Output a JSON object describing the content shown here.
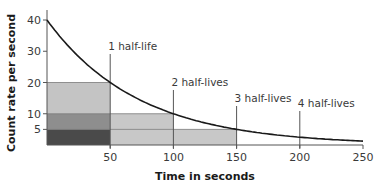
{
  "chart_data": {
    "type": "line",
    "title": "",
    "xlabel": "Time in seconds",
    "ylabel": "Count rate per second",
    "xlim": [
      0,
      250
    ],
    "ylim": [
      0,
      40
    ],
    "grid": false,
    "legend": null,
    "x_ticks": [
      50,
      100,
      150,
      200,
      250
    ],
    "y_ticks": [
      5,
      10,
      20,
      30,
      40
    ],
    "x_tick_labels": [
      "50",
      "100",
      "150",
      "200",
      "250"
    ],
    "y_tick_labels": [
      "5",
      "10",
      "20",
      "30",
      "40"
    ],
    "series": [
      {
        "name": "Count rate (exponential decay, half-life 50 s)",
        "initial_value": 40,
        "half_life": 50,
        "x": [
          0,
          25,
          50,
          75,
          100,
          125,
          150,
          175,
          200,
          225,
          250
        ],
        "values": [
          40,
          28.3,
          20,
          14.1,
          10,
          7.1,
          5,
          3.5,
          2.5,
          1.8,
          1.25
        ]
      }
    ],
    "annotations": [
      {
        "label": "1 half-life",
        "x": 50,
        "y": 20
      },
      {
        "label": "2 half-lives",
        "x": 100,
        "y": 10
      },
      {
        "label": "3 half-lives",
        "x": 150,
        "y": 5
      },
      {
        "label": "4 half-lives",
        "x": 200,
        "y": 2.5
      }
    ],
    "shaded_regions": [
      {
        "x0": 0,
        "x1": 50,
        "y0": 10,
        "y1": 20,
        "color": "#c4c4c4"
      },
      {
        "x0": 0,
        "x1": 50,
        "y0": 5,
        "y1": 10,
        "color": "#8e8e8e"
      },
      {
        "x0": 0,
        "x1": 50,
        "y0": 0,
        "y1": 5,
        "color": "#4a4a4a"
      },
      {
        "x0": 50,
        "x1": 100,
        "y0": 5,
        "y1": 10,
        "color": "#c8c8c8"
      },
      {
        "x0": 50,
        "x1": 150,
        "y0": 0,
        "y1": 5,
        "color": "#c8c8c8"
      }
    ],
    "colors": {
      "curve": "#1a1a1a",
      "axis": "#555555",
      "marker_line": "#555555"
    }
  }
}
